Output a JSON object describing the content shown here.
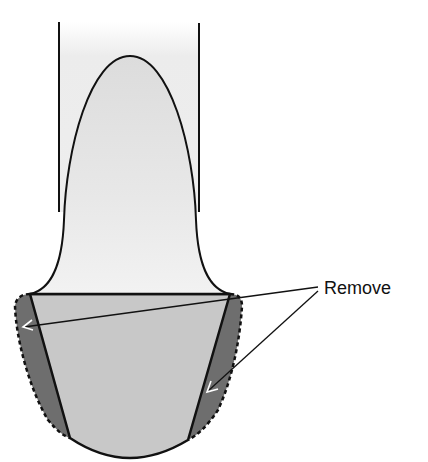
{
  "diagram": {
    "label": "Remove",
    "colors": {
      "background": "#ffffff",
      "tube_fill_top": "#ffffff",
      "tube_fill_bottom": "#ececec",
      "dome_fill": "#e2e2e2",
      "core_fill": "#c8c8c8",
      "removal_fill": "#6e6e6e",
      "outline": "#111111",
      "arrowhead": "#ffffff"
    },
    "annotations": [
      {
        "text": "Remove",
        "targets": [
          "left-removal-band",
          "right-removal-band"
        ]
      }
    ]
  }
}
